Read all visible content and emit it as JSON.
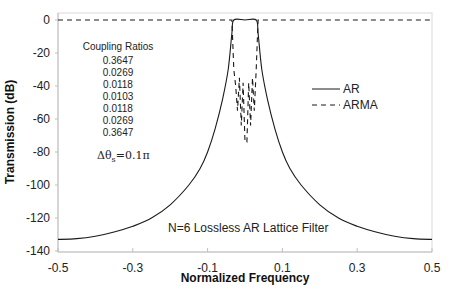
{
  "chart_data": {
    "type": "line",
    "title": "",
    "xlabel": "Normalized Frequency",
    "ylabel": "Transmission (dB)",
    "xlim": [
      -0.5,
      0.5
    ],
    "ylim": [
      -140,
      0
    ],
    "xticks": [
      "-0.5",
      "-0.3",
      "-0.1",
      "0.1",
      "0.3",
      "0.5"
    ],
    "yticks": [
      "0",
      "-20",
      "-40",
      "-60",
      "-80",
      "-100",
      "-120",
      "-140"
    ],
    "grid": false,
    "legend_position": "right-middle",
    "series": [
      {
        "name": "AR",
        "style": "solid",
        "x": [
          -0.5,
          -0.45,
          -0.4,
          -0.35,
          -0.3,
          -0.25,
          -0.2,
          -0.15,
          -0.12,
          -0.1,
          -0.08,
          -0.06,
          -0.045,
          -0.035,
          -0.03,
          0.0,
          0.03,
          0.035,
          0.045,
          0.06,
          0.08,
          0.1,
          0.12,
          0.15,
          0.2,
          0.25,
          0.3,
          0.35,
          0.4,
          0.45,
          0.5
        ],
        "y": [
          -133,
          -132.5,
          -131,
          -128.5,
          -125,
          -120,
          -112,
          -100,
          -90,
          -80,
          -66,
          -48,
          -30,
          -8,
          0,
          0,
          0,
          -8,
          -30,
          -48,
          -66,
          -80,
          -90,
          -100,
          -112,
          -120,
          -125,
          -128.5,
          -131,
          -132.5,
          -133
        ]
      },
      {
        "name": "ARMA",
        "style": "dashed",
        "x": [
          -0.5,
          -0.035,
          -0.03,
          -0.025,
          -0.02,
          -0.015,
          -0.01,
          -0.005,
          0.0,
          0.005,
          0.01,
          0.015,
          0.02,
          0.025,
          0.03,
          0.035,
          0.5
        ],
        "y": [
          0,
          0,
          -30,
          -40,
          -55,
          -35,
          -64,
          -38,
          -74,
          -74,
          -38,
          -64,
          -35,
          -55,
          -30,
          0,
          0
        ]
      }
    ],
    "annotations": [
      "Coupling Ratios",
      "0.3647",
      "0.0269",
      "0.0118",
      "0.0103",
      "0.0118",
      "0.0269",
      "0.3647",
      "Δθs=0.1π",
      "N=6 Lossless AR Lattice Filter"
    ]
  },
  "axes": {
    "xlabel": "Normalized Frequency",
    "ylabel": "Transmission (dB)",
    "xticks": [
      "-0.5",
      "-0.3",
      "-0.1",
      "0.1",
      "0.3",
      "0.5"
    ],
    "yticks": [
      "0",
      "-20",
      "-40",
      "-60",
      "-80",
      "-100",
      "-120",
      "-140"
    ]
  },
  "legend": {
    "items": [
      {
        "label": "AR",
        "style": "solid"
      },
      {
        "label": "ARMA",
        "style": "dashed"
      }
    ]
  },
  "annotations": {
    "coupling_title": "Coupling Ratios",
    "coupling_values": [
      "0.3647",
      "0.0269",
      "0.0118",
      "0.0103",
      "0.0118",
      "0.0269",
      "0.3647"
    ],
    "delta_theta_main": "Δθ",
    "delta_theta_sub": "s",
    "delta_theta_rest": "=0.1π",
    "caption": "N=6 Lossless AR Lattice Filter"
  },
  "colors": {
    "line": "#1a1a1a",
    "axis": "#bfbfbf",
    "text": "#222222"
  }
}
